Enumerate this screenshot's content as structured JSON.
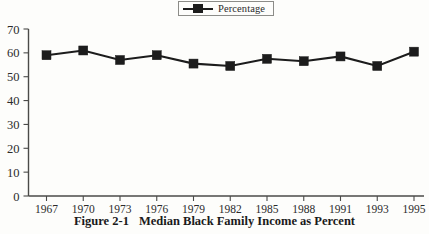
{
  "legend": {
    "label": "Percentage",
    "marker_icon": "square-marker-icon",
    "position": "top-center",
    "boxed": true
  },
  "caption": {
    "figure_number": "Figure 2-1",
    "title": "Median Black Family Income as Percent"
  },
  "colors": {
    "series": "#1c1c1c",
    "axis": "#4a4a48",
    "text": "#2b2b2b",
    "background": "#fdfdfb"
  },
  "chart_data": {
    "type": "line",
    "title": "Median Black Family Income as Percent",
    "subtitle": "",
    "xlabel": "",
    "ylabel": "",
    "categories": [
      "1967",
      "1970",
      "1973",
      "1976",
      "1979",
      "1982",
      "1985",
      "1988",
      "1991",
      "1993",
      "1995"
    ],
    "series": [
      {
        "name": "Percentage",
        "values": [
          59,
          61,
          57,
          59,
          55.5,
          54.5,
          57.5,
          56.5,
          58.5,
          54.5,
          60.5
        ]
      }
    ],
    "ylim": [
      0,
      70
    ],
    "ytick_labels": [
      "70",
      "60",
      "50",
      "40",
      "30",
      "20",
      "10",
      "0"
    ],
    "ytick_values": [
      70,
      60,
      50,
      40,
      30,
      20,
      10,
      0
    ],
    "xtick_labels": [
      "1967",
      "1970",
      "1973",
      "1976",
      "1979",
      "1982",
      "1985",
      "1988",
      "1991",
      "1993",
      "1995"
    ],
    "grid": false,
    "legend_position": "top-center",
    "marker": "square"
  }
}
